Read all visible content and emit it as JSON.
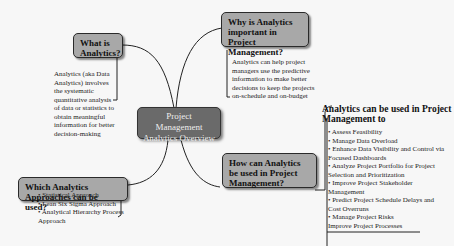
{
  "central": {
    "title": "Project Management Analytics Overview"
  },
  "branches": [
    {
      "title": "What is Analytics?",
      "text": "Analytics (aka Data Analytics) involves the systematic quantitative analysis of data or statistics to obtain meaningful information for better decision-making"
    },
    {
      "title": "Why is Analytics important in Project Management?",
      "text": "Analytics can help project managers use the predictive information to make better decisions to keep the projects on-schedule and on-budget"
    },
    {
      "title": "Which Analytics Approaches can be used?",
      "items": [
        "• Statistical Approach",
        "• Lean Six Sigma Approach",
        "• Analytical Hierarchy Process Approach"
      ]
    },
    {
      "title": "How can Analytics be used in Project Management?",
      "heading": "Analytics can be used in Project Management to",
      "items": [
        "• Assess Feasibility",
        "• Manage Data Overload",
        "• Enhance Data Visibility and Control via Focused Dashboards",
        "• Analyze Project Portfolio for Project Selection and Prioritization",
        "• Improve Project Stakeholder Management",
        "• Predict Project Schedule Delays and Cost Overruns",
        "• Manage Project Risks",
        "Improve Project Processes"
      ]
    }
  ]
}
